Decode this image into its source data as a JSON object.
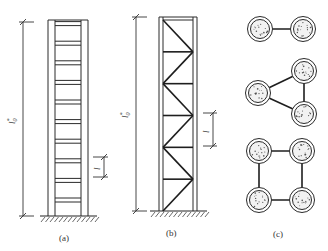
{
  "figure": {
    "panels": [
      {
        "id": "a",
        "caption": "(a)",
        "type": "batten-column",
        "overall_length_label": "l",
        "overall_length_sub": "0",
        "overall_length_sup": "*",
        "panel_length_label": "l",
        "batten_count": 10
      },
      {
        "id": "b",
        "caption": "(b)",
        "type": "laced-column",
        "overall_length_label": "l",
        "overall_length_sub": "0",
        "overall_length_sup": "*",
        "panel_length_label": "l",
        "panel_count": 6
      },
      {
        "id": "c",
        "caption": "(c)",
        "type": "cross-sections",
        "sections": [
          {
            "name": "two-limb",
            "limbs": 2
          },
          {
            "name": "three-limb",
            "limbs": 3
          },
          {
            "name": "four-limb",
            "limbs": 4
          }
        ]
      }
    ]
  }
}
